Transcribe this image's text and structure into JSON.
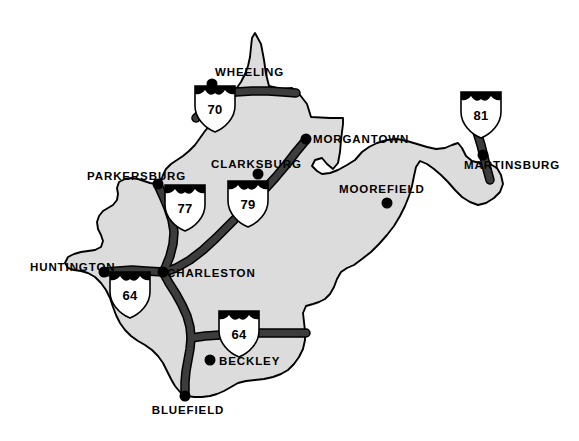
{
  "map": {
    "title": "West Virginia Interstate Highway Map",
    "state_name": "West Virginia",
    "colors": {
      "state_fill": "#dcdcdc",
      "state_outline": "#000000",
      "road": "#3c3c3c",
      "road_casing": "#000000",
      "background": "#ffffff",
      "label_text": "#000000",
      "city_dot": "#000000",
      "shield_body": "#ffffff",
      "shield_crown": "#000000"
    },
    "cities": [
      {
        "name": "WHEELING",
        "dot_x": 212,
        "dot_y": 84,
        "label_x": 215,
        "label_y": 76,
        "anchor": "start"
      },
      {
        "name": "MORGANTOWN",
        "dot_x": 306,
        "dot_y": 139,
        "label_x": 313,
        "label_y": 143,
        "anchor": "start"
      },
      {
        "name": "CLARKSBURG",
        "dot_x": 258,
        "dot_y": 174,
        "label_x": 211,
        "label_y": 168,
        "anchor": "start"
      },
      {
        "name": "MARTINSBURG",
        "dot_x": 483,
        "dot_y": 155,
        "label_x": 464,
        "label_y": 169,
        "anchor": "start"
      },
      {
        "name": "PARKERSBURG",
        "dot_x": 158,
        "dot_y": 184,
        "label_x": 87,
        "label_y": 180,
        "anchor": "start"
      },
      {
        "name": "MOOREFIELD",
        "dot_x": 387,
        "dot_y": 203,
        "label_x": 339,
        "label_y": 193,
        "anchor": "start"
      },
      {
        "name": "HUNTINGTON",
        "dot_x": 104,
        "dot_y": 272,
        "label_x": 30,
        "label_y": 271,
        "anchor": "start"
      },
      {
        "name": "CHARLESTON",
        "dot_x": 163,
        "dot_y": 272,
        "label_x": 167,
        "label_y": 277,
        "anchor": "start"
      },
      {
        "name": "BECKLEY",
        "dot_x": 210,
        "dot_y": 360,
        "label_x": 219,
        "label_y": 365,
        "anchor": "start"
      },
      {
        "name": "BLUEFIELD",
        "dot_x": 185,
        "dot_y": 396,
        "label_x": 188,
        "label_y": 414,
        "anchor": "middle"
      }
    ],
    "shields": [
      {
        "route": "70",
        "x": 215,
        "y": 108,
        "label": "Interstate 70"
      },
      {
        "route": "81",
        "x": 481,
        "y": 114,
        "label": "Interstate 81"
      },
      {
        "route": "77",
        "x": 185,
        "y": 207,
        "label": "Interstate 77"
      },
      {
        "route": "79",
        "x": 248,
        "y": 203,
        "label": "Interstate 79"
      },
      {
        "route": "64",
        "x": 130,
        "y": 294,
        "label": "Interstate 64 west"
      },
      {
        "route": "64",
        "x": 239,
        "y": 333,
        "label": "Interstate 64 east"
      }
    ],
    "highways": [
      {
        "route": "70",
        "name": "Interstate 70"
      },
      {
        "route": "77",
        "name": "Interstate 77"
      },
      {
        "route": "79",
        "name": "Interstate 79"
      },
      {
        "route": "81",
        "name": "Interstate 81"
      },
      {
        "route": "64",
        "name": "Interstate 64"
      }
    ]
  }
}
